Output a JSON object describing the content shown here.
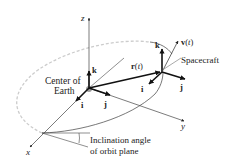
{
  "diagram": {
    "axes": {
      "z_label": "z",
      "y_label": "y",
      "x_label": "x"
    },
    "earth": {
      "label_line1": "Center of",
      "label_line2": "Earth",
      "k_label": "k",
      "i_label": "i",
      "j_label": "j"
    },
    "spacecraft": {
      "label": "Spacecraft",
      "k_label": "k",
      "i_label": "i",
      "j_label": "j",
      "velocity_label": "v(t)"
    },
    "position_vector_label": "r(t)",
    "inclination": {
      "line1": "Inclination angle",
      "line2": "of orbit plane"
    },
    "colors": {
      "line": "#333333",
      "orbit_dashed": "#cccccc",
      "earth_dot": "#9a9a9a",
      "text": "#222222"
    }
  }
}
